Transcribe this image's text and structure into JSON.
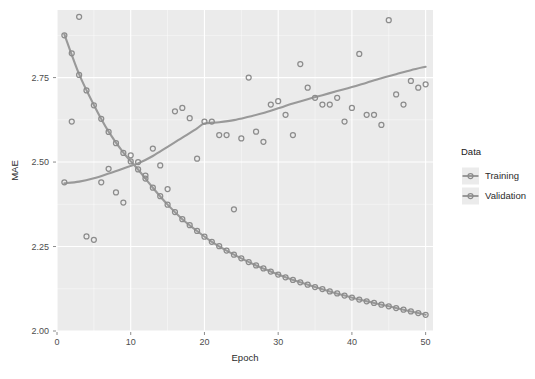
{
  "chart_data": {
    "type": "scatter",
    "title": "",
    "xlabel": "Epoch",
    "ylabel": "MAE",
    "xlim": [
      0,
      51
    ],
    "ylim": [
      2.0,
      2.95
    ],
    "xticks": [
      0,
      10,
      20,
      30,
      40,
      50
    ],
    "xtick_labels": [
      "0",
      "10",
      "20",
      "30",
      "40",
      "50"
    ],
    "yticks": [
      2.0,
      2.25,
      2.5,
      2.75
    ],
    "ytick_labels": [
      "2.00",
      "2.25",
      "2.50",
      "2.75"
    ],
    "grid": true,
    "grid_minor": true,
    "legend_position": "right",
    "legend_title": "Data",
    "panel_background": "#ebebeb",
    "grid_color": "#ffffff",
    "series": [
      {
        "name": "Training",
        "color": "#8c8c8c",
        "line_color": "#999999",
        "marker": "circle",
        "x": [
          1,
          2,
          3,
          4,
          5,
          6,
          7,
          8,
          9,
          10,
          11,
          12,
          13,
          14,
          15,
          16,
          17,
          18,
          19,
          20,
          21,
          22,
          23,
          24,
          25,
          26,
          27,
          28,
          29,
          30,
          31,
          32,
          33,
          34,
          35,
          36,
          37,
          38,
          39,
          40,
          41,
          42,
          43,
          44,
          45,
          46,
          47,
          48,
          49,
          50
        ],
        "y": [
          2.875,
          2.822,
          2.758,
          2.712,
          2.668,
          2.628,
          2.589,
          2.556,
          2.527,
          2.502,
          2.478,
          2.451,
          2.424,
          2.399,
          2.374,
          2.352,
          2.331,
          2.313,
          2.296,
          2.279,
          2.264,
          2.251,
          2.238,
          2.226,
          2.215,
          2.204,
          2.194,
          2.185,
          2.176,
          2.167,
          2.159,
          2.151,
          2.144,
          2.137,
          2.13,
          2.124,
          2.117,
          2.111,
          2.105,
          2.099,
          2.093,
          2.088,
          2.083,
          2.078,
          2.073,
          2.068,
          2.063,
          2.058,
          2.053,
          2.048
        ],
        "smooth_x": [
          1,
          3,
          5,
          7,
          9,
          11,
          13,
          15,
          17,
          19,
          21,
          23,
          25,
          27,
          29,
          31,
          33,
          35,
          37,
          39,
          41,
          43,
          45,
          47,
          49,
          50
        ],
        "smooth_y": [
          2.878,
          2.76,
          2.669,
          2.59,
          2.528,
          2.478,
          2.424,
          2.374,
          2.331,
          2.296,
          2.264,
          2.238,
          2.215,
          2.194,
          2.176,
          2.159,
          2.144,
          2.13,
          2.117,
          2.105,
          2.093,
          2.083,
          2.073,
          2.063,
          2.053,
          2.048
        ]
      },
      {
        "name": "Validation",
        "color": "#8c8c8c",
        "line_color": "#999999",
        "marker": "circle",
        "x": [
          1,
          2,
          3,
          4,
          5,
          6,
          7,
          8,
          9,
          10,
          11,
          12,
          13,
          14,
          15,
          16,
          17,
          18,
          19,
          20,
          21,
          22,
          23,
          24,
          25,
          26,
          27,
          28,
          29,
          30,
          31,
          32,
          33,
          34,
          35,
          36,
          37,
          38,
          39,
          40,
          41,
          42,
          43,
          44,
          45,
          46,
          47,
          48,
          49,
          50
        ],
        "y": [
          2.44,
          2.62,
          2.93,
          2.28,
          2.27,
          2.44,
          2.48,
          2.41,
          2.38,
          2.52,
          2.5,
          2.46,
          2.54,
          2.49,
          2.42,
          2.65,
          2.66,
          2.63,
          2.51,
          2.62,
          2.62,
          2.58,
          2.58,
          2.36,
          2.57,
          2.75,
          2.59,
          2.56,
          2.67,
          2.68,
          2.64,
          2.58,
          2.79,
          2.72,
          2.69,
          2.67,
          2.67,
          2.69,
          2.62,
          2.66,
          2.82,
          2.64,
          2.64,
          2.61,
          2.92,
          2.7,
          2.67,
          2.74,
          2.72,
          2.73
        ],
        "smooth_x": [
          1,
          3,
          5,
          7,
          9,
          11,
          13,
          15,
          17,
          19,
          20,
          22,
          24,
          26,
          28,
          30,
          32,
          34,
          36,
          38,
          40,
          42,
          44,
          46,
          48,
          50
        ],
        "smooth_y": [
          2.437,
          2.442,
          2.452,
          2.466,
          2.481,
          2.496,
          2.518,
          2.545,
          2.572,
          2.6,
          2.614,
          2.618,
          2.624,
          2.634,
          2.645,
          2.659,
          2.673,
          2.686,
          2.698,
          2.71,
          2.722,
          2.735,
          2.748,
          2.76,
          2.772,
          2.782
        ]
      }
    ]
  },
  "legend": {
    "title": "Data",
    "items": [
      {
        "label": "Training"
      },
      {
        "label": "Validation"
      }
    ]
  },
  "axes": {
    "x_title": "Epoch",
    "y_title": "MAE"
  }
}
